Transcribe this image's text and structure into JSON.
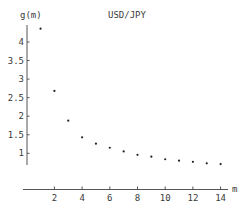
{
  "chart_data": {
    "type": "scatter",
    "title": "USD/JPY",
    "xlabel": "m",
    "ylabel": "g(m)",
    "x": [
      1,
      2,
      3,
      4,
      5,
      6,
      7,
      8,
      9,
      10,
      11,
      12,
      13,
      14
    ],
    "series": [
      {
        "name": "USD/JPY",
        "values": [
          4.36,
          2.68,
          1.88,
          1.43,
          1.26,
          1.15,
          1.05,
          0.96,
          0.91,
          0.84,
          0.8,
          0.77,
          0.73,
          0.71
        ]
      }
    ],
    "xticks": [
      2,
      4,
      6,
      8,
      10,
      12,
      14
    ],
    "xtick_labels": [
      "2",
      "4",
      "6",
      "8",
      "10",
      "12",
      "14"
    ],
    "yticks": [
      1,
      1.5,
      2,
      2.5,
      3,
      3.5,
      4
    ],
    "ytick_labels": [
      "1",
      "1.5",
      "2",
      "2.5",
      "3",
      "3.5",
      "4"
    ],
    "xlim": [
      0,
      14.5
    ],
    "ylim": [
      0.7,
      4.5
    ],
    "grid": false,
    "legend": "none"
  }
}
